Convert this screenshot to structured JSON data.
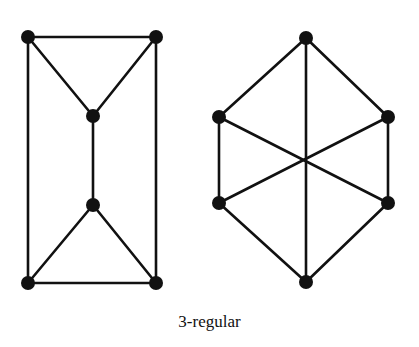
{
  "caption": "3-regular",
  "colors": {
    "edge": "#111111",
    "node": "#111111",
    "background": "#ffffff"
  },
  "graphs": [
    {
      "name": "left-graph",
      "nodes": [
        {
          "id": "a",
          "x": 28,
          "y": 37
        },
        {
          "id": "b",
          "x": 156,
          "y": 37
        },
        {
          "id": "c",
          "x": 93,
          "y": 116
        },
        {
          "id": "d",
          "x": 93,
          "y": 205
        },
        {
          "id": "e",
          "x": 28,
          "y": 283
        },
        {
          "id": "f",
          "x": 156,
          "y": 283
        }
      ],
      "edges": [
        [
          "a",
          "b"
        ],
        [
          "a",
          "c"
        ],
        [
          "b",
          "c"
        ],
        [
          "c",
          "d"
        ],
        [
          "d",
          "e"
        ],
        [
          "d",
          "f"
        ],
        [
          "e",
          "f"
        ],
        [
          "a",
          "e"
        ],
        [
          "b",
          "f"
        ]
      ]
    },
    {
      "name": "right-graph",
      "nodes": [
        {
          "id": "t",
          "x": 306,
          "y": 38
        },
        {
          "id": "ul",
          "x": 219,
          "y": 117
        },
        {
          "id": "ur",
          "x": 388,
          "y": 117
        },
        {
          "id": "ll",
          "x": 219,
          "y": 203
        },
        {
          "id": "lr",
          "x": 388,
          "y": 203
        },
        {
          "id": "bt",
          "x": 306,
          "y": 282
        }
      ],
      "edges": [
        [
          "t",
          "ul"
        ],
        [
          "t",
          "ur"
        ],
        [
          "t",
          "bt"
        ],
        [
          "ul",
          "ll"
        ],
        [
          "ur",
          "lr"
        ],
        [
          "ul",
          "lr"
        ],
        [
          "ur",
          "ll"
        ],
        [
          "ll",
          "bt"
        ],
        [
          "lr",
          "bt"
        ]
      ]
    }
  ]
}
